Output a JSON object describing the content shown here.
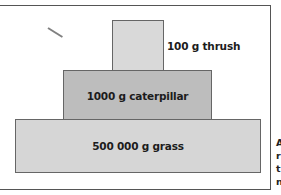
{
  "diagram": {
    "type": "pyramid of biomass",
    "levels": [
      {
        "rank": "top",
        "mass": "100 g",
        "organism": "thrush",
        "label": "100 g thrush",
        "fill": "#d9d9d9"
      },
      {
        "rank": "middle",
        "mass": "1000 g",
        "organism": "caterpillar",
        "label": "1000 g caterpillar",
        "fill": "#bdbdbd"
      },
      {
        "rank": "bottom",
        "mass": "500 000 g",
        "organism": "grass",
        "label": "500 000 g grass",
        "fill": "#d6d6d6"
      }
    ]
  },
  "caption_fragment": {
    "lines": [
      "A",
      "r",
      "t",
      "n"
    ]
  }
}
